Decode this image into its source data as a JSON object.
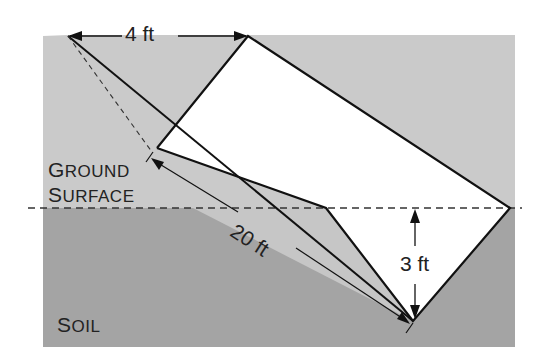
{
  "figure": {
    "labels": {
      "ground_line1_initial": "G",
      "ground_line1_rest": "ROUND",
      "ground_line2_initial": "S",
      "ground_line2_rest": "URFACE",
      "soil_initial": "S",
      "soil_rest": "OIL"
    },
    "dimensions": {
      "width": "4 ft",
      "slope_length": "20 ft",
      "depth": "3 ft"
    },
    "colors": {
      "light_fill": "#c9c9c9",
      "dark_fill": "#a3a3a3",
      "line": "#111111",
      "background": "#ffffff"
    }
  }
}
